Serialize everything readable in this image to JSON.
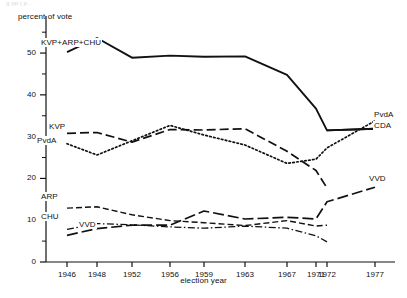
{
  "header": {
    "faint_top_text": "g                                 pp        j   p       ,"
  },
  "axis": {
    "ylabel": "percent of vote",
    "xlabel": "election year",
    "yticks": [
      0,
      10,
      20,
      30,
      40,
      50
    ],
    "yminor": [
      5,
      15,
      25,
      35,
      45,
      55
    ],
    "ylim": [
      0,
      56
    ],
    "xticks": [
      "1946",
      "1948",
      "1952",
      "1956",
      "1959",
      "1963",
      "1967",
      "1971",
      "1972",
      "1977"
    ]
  },
  "labels": {
    "kvp_arp_chu": "KVP+ARP+CHU",
    "kvp": "KVP",
    "pvda_left": "PvdA",
    "arp": "ARP",
    "chu": "CHU",
    "vvd_left": "VVD",
    "pvda_right": "PvdA",
    "cda_right": "CDA",
    "vvd_right": "VVD"
  },
  "colors": {
    "line": "#111111",
    "text": "#111111",
    "background": "#ffffff"
  },
  "chart_data": {
    "type": "line",
    "title": "",
    "xlabel": "election year",
    "ylabel": "percent of vote",
    "ylim": [
      0,
      56
    ],
    "grid": false,
    "legend": "inline-annotations",
    "x": [
      "1946",
      "1948",
      "1952",
      "1956",
      "1959",
      "1963",
      "1967",
      "1971",
      "1972",
      "1977"
    ],
    "series": [
      {
        "name": "KVP+ARP+CHU",
        "style": "solid",
        "values": [
          50.2,
          53.6,
          48.9,
          49.4,
          49.1,
          49.2,
          44.8,
          36.7,
          31.5,
          31.9
        ]
      },
      {
        "name": "KVP",
        "style": "dashed",
        "values": [
          30.8,
          31.0,
          28.7,
          31.7,
          31.6,
          31.9,
          26.5,
          21.9,
          17.7,
          null
        ]
      },
      {
        "name": "PvdA",
        "style": "dotted",
        "values": [
          28.3,
          25.6,
          29.0,
          32.7,
          30.4,
          28.0,
          23.6,
          24.6,
          27.3,
          33.8
        ]
      },
      {
        "name": "ARP",
        "style": "dashed-fine",
        "values": [
          12.9,
          13.2,
          11.3,
          9.9,
          9.4,
          8.7,
          9.9,
          8.6,
          8.8,
          null
        ]
      },
      {
        "name": "CHU",
        "style": "dash-dot",
        "values": [
          7.8,
          9.2,
          8.9,
          8.4,
          8.1,
          8.6,
          8.1,
          6.3,
          4.8,
          null
        ]
      },
      {
        "name": "VVD",
        "style": "dashed-long",
        "values": [
          6.4,
          8.0,
          8.8,
          8.8,
          12.2,
          10.3,
          10.7,
          10.3,
          14.4,
          17.9
        ]
      },
      {
        "name": "CDA",
        "style": "solid",
        "values": [
          null,
          null,
          null,
          null,
          null,
          null,
          null,
          null,
          31.5,
          31.9
        ]
      }
    ]
  }
}
